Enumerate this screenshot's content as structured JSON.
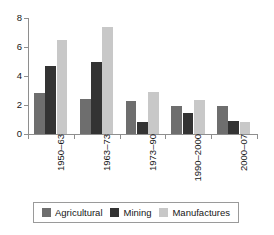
{
  "chart_data": {
    "type": "bar",
    "title": "",
    "subtitle": "",
    "xlabel": "",
    "ylabel": "",
    "ylim": [
      0,
      8
    ],
    "yticks": [
      0,
      2,
      4,
      6,
      8
    ],
    "ytick_labels": [
      "0",
      "2",
      "4",
      "6",
      "8"
    ],
    "grid": false,
    "legend_position": "bottom",
    "categories": [
      "1950–63",
      "1963–73",
      "1973–90",
      "1990–2000",
      "2000–07"
    ],
    "series": [
      {
        "name": "Agricultural",
        "color": "#6e6e6e",
        "values": [
          2.85,
          2.4,
          2.25,
          1.95,
          1.92
        ]
      },
      {
        "name": "Mining",
        "color": "#333333",
        "values": [
          4.7,
          4.95,
          0.85,
          1.42,
          0.88
        ]
      },
      {
        "name": "Manufactures",
        "color": "#c8c8c8",
        "values": [
          6.5,
          7.35,
          2.9,
          2.35,
          0.85
        ]
      }
    ]
  },
  "axis": {
    "color": "#8e8e8e"
  },
  "legend": {
    "items": [
      {
        "label": "Agricultural",
        "color": "#6e6e6e"
      },
      {
        "label": "Mining",
        "color": "#333333"
      },
      {
        "label": "Manufactures",
        "color": "#c8c8c8"
      }
    ]
  }
}
